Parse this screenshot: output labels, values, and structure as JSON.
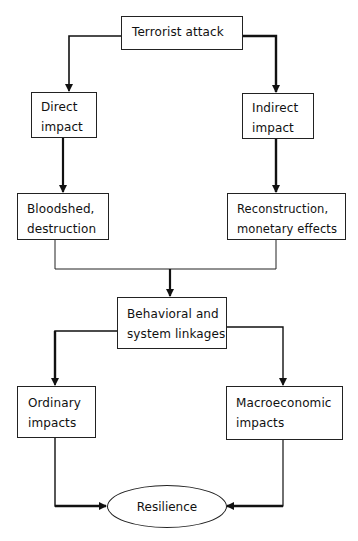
{
  "diagram": {
    "type": "flowchart",
    "nodes": {
      "terrorist_attack": "Terrorist attack",
      "direct_impact": "Direct\nimpact",
      "indirect_impact": "Indirect\nimpact",
      "bloodshed": "Bloodshed,\ndestruction",
      "reconstruction": "Reconstruction,\nmonetary effects",
      "behavioral": "Behavioral and\nsystem linkages",
      "ordinary": "Ordinary\nimpacts",
      "macroeconomic": "Macroeconomic\nimpacts",
      "resilience": "Resilience"
    },
    "edges": [
      {
        "from": "Terrorist attack",
        "to": "Direct impact"
      },
      {
        "from": "Terrorist attack",
        "to": "Indirect impact"
      },
      {
        "from": "Direct impact",
        "to": "Bloodshed, destruction"
      },
      {
        "from": "Indirect impact",
        "to": "Reconstruction, monetary effects"
      },
      {
        "from": "Bloodshed, destruction",
        "to": "Behavioral and system linkages"
      },
      {
        "from": "Reconstruction, monetary effects",
        "to": "Behavioral and system linkages"
      },
      {
        "from": "Behavioral and system linkages",
        "to": "Ordinary impacts"
      },
      {
        "from": "Behavioral and system linkages",
        "to": "Macroeconomic impacts"
      },
      {
        "from": "Ordinary impacts",
        "to": "Resilience"
      },
      {
        "from": "Macroeconomic impacts",
        "to": "Resilience"
      }
    ],
    "colors": {
      "stroke": "#222222",
      "fill": "#ffffff",
      "text": "#111111"
    }
  }
}
